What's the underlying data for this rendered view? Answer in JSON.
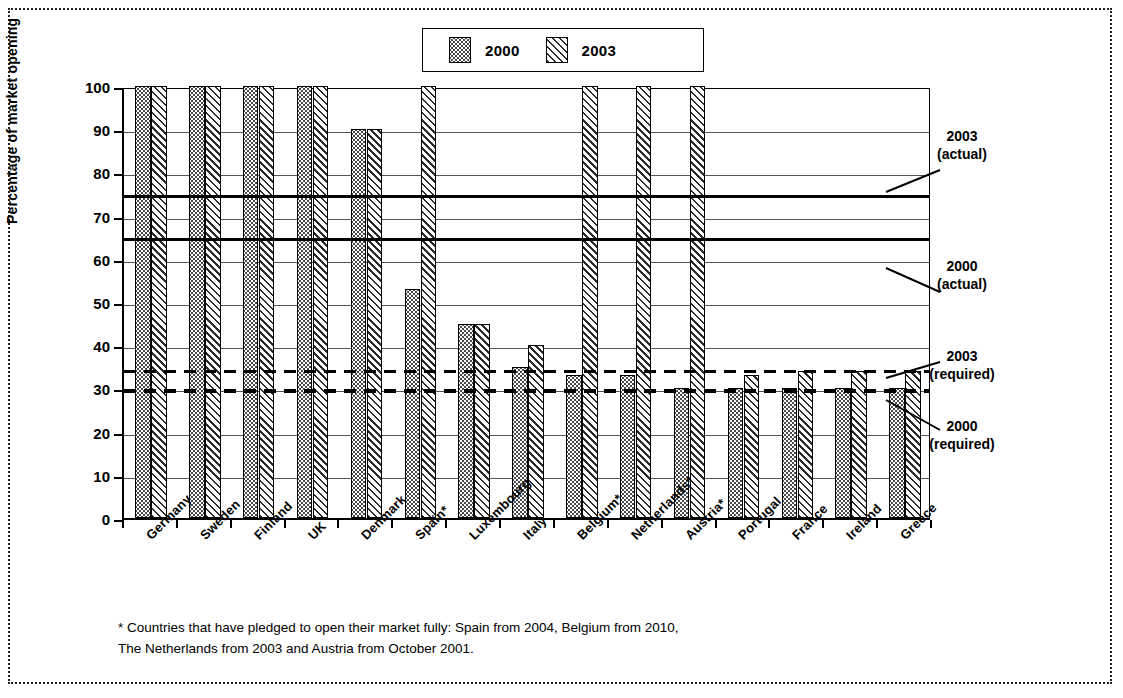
{
  "legend": {
    "entries": [
      {
        "label": "2000",
        "pattern": "dotted",
        "color": "#4a4a4a"
      },
      {
        "label": "2003",
        "pattern": "diagonal-hatch",
        "color": "#2a2a2a"
      }
    ]
  },
  "axes": {
    "ylabel": "Percentage of market opening",
    "yticks": [
      0,
      10,
      20,
      30,
      40,
      50,
      60,
      70,
      80,
      90,
      100
    ],
    "ylim": [
      0,
      100
    ]
  },
  "annotations": [
    {
      "id": "a2003actual",
      "line1": "2003",
      "line2": "(actual)",
      "value": 75
    },
    {
      "id": "a2000actual",
      "line1": "2000",
      "line2": "(actual)",
      "value": 65
    },
    {
      "id": "a2003required",
      "line1": "2003",
      "line2": "(required)",
      "value": 34.5
    },
    {
      "id": "a2000required",
      "line1": "2000",
      "line2": "(required)",
      "value": 30
    }
  ],
  "footnote": {
    "line1": "* Countries that have pledged to open their market fully: Spain from 2004, Belgium from 2010,",
    "line2": "The Netherlands from 2003 and Austria from October 2001."
  },
  "chart_data": {
    "type": "bar",
    "title": "",
    "xlabel": "",
    "ylabel": "Percentage of market opening",
    "ylim": [
      0,
      100
    ],
    "yticks": [
      0,
      10,
      20,
      30,
      40,
      50,
      60,
      70,
      80,
      90,
      100
    ],
    "grid": true,
    "legend_position": "top-center",
    "categories": [
      "Germany",
      "Sweden",
      "Finland",
      "UK",
      "Denmark",
      "Spain*",
      "Luxembourg",
      "Italy",
      "Belgium*",
      "Netherlands*",
      "Austria*",
      "Portugal",
      "France",
      "Ireland",
      "Greece"
    ],
    "series": [
      {
        "name": "2000",
        "values": [
          100,
          100,
          100,
          100,
          90,
          53,
          45,
          35,
          33,
          33,
          30,
          30,
          30,
          30,
          30
        ]
      },
      {
        "name": "2003",
        "values": [
          100,
          100,
          100,
          100,
          90,
          100,
          45,
          40,
          100,
          100,
          100,
          33,
          34,
          34,
          34
        ]
      }
    ],
    "reference_lines": [
      {
        "label": "2003 (actual)",
        "value": 75,
        "style": "solid"
      },
      {
        "label": "2000 (actual)",
        "value": 65,
        "style": "solid"
      },
      {
        "label": "2003 (required)",
        "value": 34.5,
        "style": "dashed"
      },
      {
        "label": "2000 (required)",
        "value": 30,
        "style": "dashed"
      }
    ]
  }
}
